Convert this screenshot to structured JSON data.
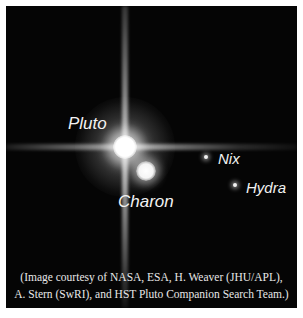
{
  "image": {
    "description": "Hubble image of Pluto and its moons",
    "background_color": "#050505",
    "labels": {
      "pluto": "Pluto",
      "charon": "Charon",
      "nix": "Nix",
      "hydra": "Hydra"
    },
    "caption": {
      "line1": "(Image courtesy of NASA, ESA, H. Weaver (JHU/APL),",
      "line2": "A. Stern (SwRI), and HST Pluto Companion Search Team.)"
    }
  }
}
